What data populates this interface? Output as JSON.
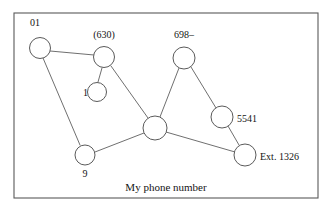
{
  "figure": {
    "caption": "My phone number",
    "caption_x": 166,
    "caption_y": 191,
    "frame": {
      "x": 14,
      "y": 13,
      "width": 304,
      "height": 185,
      "stroke_color": "#5a5a5a"
    },
    "colors": {
      "node_stroke": "#5a5a5a",
      "node_fill": "#ffffff",
      "edge_stroke": "#5f5f5f",
      "text": "#141414",
      "background": "#ffffff"
    }
  },
  "nodes": [
    {
      "id": "country-code",
      "label": "01",
      "cx": 40,
      "cy": 48,
      "r": 10.5,
      "label_x": 30,
      "label_y": 26,
      "label_anchor": "start"
    },
    {
      "id": "area-code",
      "label": "(630)",
      "cx": 104,
      "cy": 57,
      "r": 10.5,
      "label_x": 104,
      "label_y": 38,
      "label_anchor": "middle"
    },
    {
      "id": "trunk-prefix",
      "label": "1",
      "cx": 97,
      "cy": 92,
      "r": 9.5,
      "label_x": 83,
      "label_y": 96,
      "label_anchor": "start"
    },
    {
      "id": "long-distance",
      "label": "9",
      "cx": 85,
      "cy": 155,
      "r": 10,
      "label_x": 85,
      "label_y": 177,
      "label_anchor": "middle"
    },
    {
      "id": "exchange",
      "label": "698–",
      "cx": 184,
      "cy": 58,
      "r": 11,
      "label_x": 184,
      "label_y": 38,
      "label_anchor": "middle"
    },
    {
      "id": "line-number",
      "label": "5541",
      "cx": 222,
      "cy": 117,
      "r": 11,
      "label_x": 237,
      "label_y": 122,
      "label_anchor": "start"
    },
    {
      "id": "extension",
      "label": "Ext. 1326",
      "cx": 245,
      "cy": 155,
      "r": 11,
      "label_x": 260,
      "label_y": 160,
      "label_anchor": "start"
    },
    {
      "id": "hub",
      "label": "",
      "cx": 155,
      "cy": 128,
      "r": 12,
      "label_x": 155,
      "label_y": 128,
      "label_anchor": "middle"
    }
  ],
  "edges": [
    {
      "id": "edge-country-to-area",
      "from": "country-code",
      "to": "area-code",
      "x1": 50,
      "y1": 51,
      "x2": 94,
      "y2": 55
    },
    {
      "id": "edge-country-to-nine",
      "from": "country-code",
      "to": "long-distance",
      "x1": 43,
      "y1": 58,
      "x2": 80,
      "y2": 145
    },
    {
      "id": "edge-area-to-one",
      "from": "area-code",
      "to": "trunk-prefix",
      "x1": 102,
      "y1": 68,
      "x2": 98,
      "y2": 82
    },
    {
      "id": "edge-area-to-hub",
      "from": "area-code",
      "to": "hub",
      "x1": 111,
      "y1": 66,
      "x2": 148,
      "y2": 118
    },
    {
      "id": "edge-nine-to-hub",
      "from": "long-distance",
      "to": "hub",
      "x1": 95,
      "y1": 152,
      "x2": 144,
      "y2": 133
    },
    {
      "id": "edge-exchange-to-hub",
      "from": "exchange",
      "to": "hub",
      "x1": 179,
      "y1": 68,
      "x2": 160,
      "y2": 117
    },
    {
      "id": "edge-exchange-to-line",
      "from": "exchange",
      "to": "line-number",
      "x1": 191,
      "y1": 67,
      "x2": 216,
      "y2": 108
    },
    {
      "id": "edge-line-to-extension",
      "from": "line-number",
      "to": "extension",
      "x1": 228,
      "y1": 126,
      "x2": 239,
      "y2": 145
    },
    {
      "id": "edge-hub-to-extension",
      "from": "hub",
      "to": "extension",
      "x1": 166,
      "y1": 132,
      "x2": 235,
      "y2": 152
    }
  ]
}
